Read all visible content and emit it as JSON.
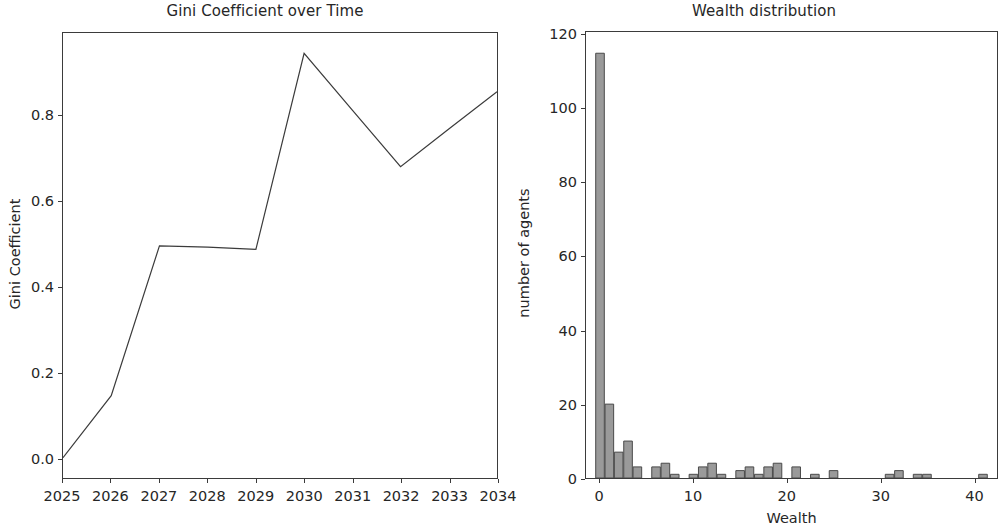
{
  "figure": {
    "background": "#ffffff",
    "width": 1006,
    "height": 520
  },
  "chart_data": [
    {
      "type": "line",
      "title": "Gini Coefficient over Time",
      "xlabel": "",
      "ylabel": "Gini Coefficient",
      "x": [
        2025,
        2026,
        2027,
        2028,
        2029,
        2030,
        2031,
        2032,
        2033,
        2034
      ],
      "categories": [
        "2025",
        "2026",
        "2027",
        "2028",
        "2029",
        "2030",
        "2031",
        "2032",
        "2033",
        "2034"
      ],
      "values": [
        0.0,
        0.145,
        0.495,
        0.492,
        0.487,
        0.945,
        0.812,
        0.68,
        0.768,
        0.855
      ],
      "xtick_labels": [
        "2025",
        "2026",
        "2027",
        "2028",
        "2029",
        "2030",
        "2031",
        "2032",
        "2033",
        "2034"
      ],
      "ytick_labels": [
        "0.0",
        "0.2",
        "0.4",
        "0.6",
        "0.8"
      ],
      "ytick_values": [
        0.0,
        0.2,
        0.4,
        0.6,
        0.8
      ],
      "xlim": [
        2025,
        2034
      ],
      "ylim": [
        -0.0473,
        0.9923
      ],
      "grid": false,
      "legend": false,
      "line_color": "#3b3b3b",
      "line_width": 1.2
    },
    {
      "type": "bar",
      "title": "Wealth distribution",
      "xlabel": "Wealth",
      "ylabel": "number of agents",
      "categories": [
        "0",
        "1",
        "2",
        "3",
        "4",
        "5",
        "6",
        "7",
        "8",
        "9",
        "10",
        "11",
        "12",
        "13",
        "14",
        "15",
        "16",
        "17",
        "18",
        "19",
        "20",
        "21",
        "22",
        "23",
        "24",
        "25",
        "26",
        "27",
        "28",
        "29",
        "30",
        "31",
        "32",
        "33",
        "34",
        "35",
        "36",
        "37",
        "38",
        "39",
        "40",
        "41"
      ],
      "x": [
        0,
        1,
        2,
        3,
        4,
        5,
        6,
        7,
        8,
        9,
        10,
        11,
        12,
        13,
        14,
        15,
        16,
        17,
        18,
        19,
        20,
        21,
        22,
        23,
        24,
        25,
        26,
        27,
        28,
        29,
        30,
        31,
        32,
        33,
        34,
        35,
        36,
        37,
        38,
        39,
        40,
        41
      ],
      "values": [
        115,
        20,
        7,
        10,
        3,
        0,
        3,
        4,
        1,
        0,
        1,
        3,
        4,
        1,
        0,
        2,
        3,
        1,
        3,
        4,
        0,
        3,
        0,
        1,
        0,
        2,
        0,
        0,
        0,
        0,
        0,
        1,
        2,
        0,
        1,
        1,
        0,
        0,
        0,
        0,
        0,
        1
      ],
      "xtick_labels": [
        "0",
        "10",
        "20",
        "30",
        "40"
      ],
      "xtick_values": [
        0,
        10,
        20,
        30,
        40
      ],
      "ytick_labels": [
        "0",
        "20",
        "40",
        "60",
        "80",
        "100",
        "120"
      ],
      "ytick_values": [
        0,
        20,
        40,
        60,
        80,
        100,
        120
      ],
      "xlim": [
        -1.5,
        42.5
      ],
      "ylim": [
        0,
        120.75
      ],
      "grid": false,
      "legend": false,
      "bar_face_color": "#9a9a9a",
      "bar_edge_color": "#4a4a4a"
    }
  ]
}
